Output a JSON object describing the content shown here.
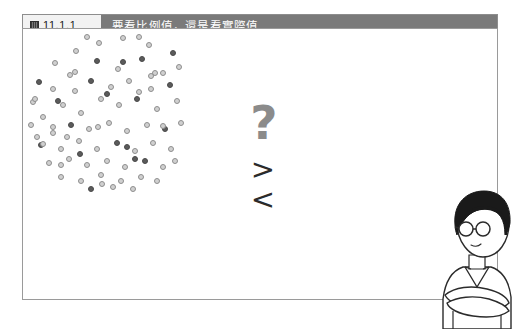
{
  "figure": {
    "number_label": "11.1.1",
    "number_icon": "figure-grid-icon",
    "title": "要看比例值，還是看實際值"
  },
  "comparison": {
    "question_symbol": "?",
    "greater_symbol": ">",
    "less_symbol": "<"
  },
  "colors": {
    "header_bar": "#7a7a7a",
    "number_box": "#f2f2f2",
    "title_text": "#ffffff",
    "dish_fill": "#dedede",
    "dish_stroke": "#5e5e5e",
    "dot_ring_fill": "#d0d0d0",
    "dot_ring_stroke": "#8e8e8e",
    "dot_solid": "#5b5b5b",
    "question_mark": "#8b8b8b",
    "chevron": "#2b2b2b",
    "frame_border": "#9a9a9a",
    "hair": "#1a1a1a",
    "skin": "#ffffff",
    "outline": "#2b2b2b"
  },
  "dish_left": {
    "label": "dense-dish",
    "dot_count": 68,
    "dots": [
      {
        "x": 53,
        "y": 22,
        "t": "ring"
      },
      {
        "x": 76,
        "y": 14,
        "t": "ring"
      },
      {
        "x": 100,
        "y": 9,
        "t": "ring"
      },
      {
        "x": 126,
        "y": 16,
        "t": "ring"
      },
      {
        "x": 150,
        "y": 24,
        "t": "solid"
      },
      {
        "x": 32,
        "y": 34,
        "t": "ring"
      },
      {
        "x": 16,
        "y": 53,
        "t": "solid"
      },
      {
        "x": 47,
        "y": 46,
        "t": "ring"
      },
      {
        "x": 74,
        "y": 32,
        "t": "solid"
      },
      {
        "x": 95,
        "y": 40,
        "t": "ring"
      },
      {
        "x": 119,
        "y": 30,
        "t": "solid"
      },
      {
        "x": 140,
        "y": 44,
        "t": "ring"
      },
      {
        "x": 156,
        "y": 38,
        "t": "ring"
      },
      {
        "x": 10,
        "y": 73,
        "t": "ring"
      },
      {
        "x": 30,
        "y": 60,
        "t": "ring"
      },
      {
        "x": 52,
        "y": 62,
        "t": "ring"
      },
      {
        "x": 68,
        "y": 52,
        "t": "solid"
      },
      {
        "x": 88,
        "y": 58,
        "t": "ring"
      },
      {
        "x": 106,
        "y": 52,
        "t": "ring"
      },
      {
        "x": 128,
        "y": 60,
        "t": "ring"
      },
      {
        "x": 147,
        "y": 56,
        "t": "solid"
      },
      {
        "x": 20,
        "y": 88,
        "t": "ring"
      },
      {
        "x": 40,
        "y": 76,
        "t": "ring"
      },
      {
        "x": 58,
        "y": 84,
        "t": "ring"
      },
      {
        "x": 78,
        "y": 70,
        "t": "ring"
      },
      {
        "x": 96,
        "y": 76,
        "t": "ring"
      },
      {
        "x": 114,
        "y": 70,
        "t": "solid"
      },
      {
        "x": 134,
        "y": 80,
        "t": "ring"
      },
      {
        "x": 154,
        "y": 72,
        "t": "ring"
      },
      {
        "x": 8,
        "y": 96,
        "t": "ring"
      },
      {
        "x": 30,
        "y": 104,
        "t": "ring"
      },
      {
        "x": 48,
        "y": 96,
        "t": "solid"
      },
      {
        "x": 66,
        "y": 100,
        "t": "ring"
      },
      {
        "x": 86,
        "y": 94,
        "t": "ring"
      },
      {
        "x": 104,
        "y": 102,
        "t": "ring"
      },
      {
        "x": 124,
        "y": 96,
        "t": "ring"
      },
      {
        "x": 142,
        "y": 100,
        "t": "solid"
      },
      {
        "x": 158,
        "y": 94,
        "t": "ring"
      },
      {
        "x": 18,
        "y": 116,
        "t": "solid"
      },
      {
        "x": 38,
        "y": 120,
        "t": "ring"
      },
      {
        "x": 56,
        "y": 112,
        "t": "ring"
      },
      {
        "x": 74,
        "y": 120,
        "t": "ring"
      },
      {
        "x": 94,
        "y": 114,
        "t": "solid"
      },
      {
        "x": 112,
        "y": 122,
        "t": "ring"
      },
      {
        "x": 130,
        "y": 114,
        "t": "ring"
      },
      {
        "x": 148,
        "y": 120,
        "t": "ring"
      },
      {
        "x": 26,
        "y": 134,
        "t": "ring"
      },
      {
        "x": 46,
        "y": 130,
        "t": "ring"
      },
      {
        "x": 64,
        "y": 136,
        "t": "ring"
      },
      {
        "x": 84,
        "y": 132,
        "t": "ring"
      },
      {
        "x": 102,
        "y": 138,
        "t": "ring"
      },
      {
        "x": 122,
        "y": 132,
        "t": "solid"
      },
      {
        "x": 140,
        "y": 138,
        "t": "ring"
      },
      {
        "x": 38,
        "y": 148,
        "t": "ring"
      },
      {
        "x": 58,
        "y": 152,
        "t": "ring"
      },
      {
        "x": 78,
        "y": 146,
        "t": "ring"
      },
      {
        "x": 98,
        "y": 152,
        "t": "ring"
      },
      {
        "x": 118,
        "y": 148,
        "t": "ring"
      },
      {
        "x": 134,
        "y": 152,
        "t": "ring"
      },
      {
        "x": 68,
        "y": 160,
        "t": "solid"
      },
      {
        "x": 90,
        "y": 158,
        "t": "ring"
      },
      {
        "x": 110,
        "y": 160,
        "t": "ring"
      },
      {
        "x": 152,
        "y": 132,
        "t": "ring"
      },
      {
        "x": 14,
        "y": 108,
        "t": "ring"
      },
      {
        "x": 64,
        "y": 8,
        "t": "ring"
      },
      {
        "x": 116,
        "y": 8,
        "t": "ring"
      },
      {
        "x": 44,
        "y": 108,
        "t": "ring"
      },
      {
        "x": 132,
        "y": 44,
        "t": "ring"
      }
    ]
  },
  "dish_right": {
    "label": "sparse-dish",
    "dot_count": 16,
    "dots": [
      {
        "x": 100,
        "y": 33,
        "t": "solid"
      },
      {
        "x": 52,
        "y": 43,
        "t": "ring"
      },
      {
        "x": 84,
        "y": 65,
        "t": "solid"
      },
      {
        "x": 116,
        "y": 63,
        "t": "ring"
      },
      {
        "x": 12,
        "y": 70,
        "t": "ring"
      },
      {
        "x": 35,
        "y": 72,
        "t": "solid"
      },
      {
        "x": 30,
        "y": 98,
        "t": "ring"
      },
      {
        "x": 75,
        "y": 98,
        "t": "ring"
      },
      {
        "x": 140,
        "y": 97,
        "t": "ring"
      },
      {
        "x": 104,
        "y": 118,
        "t": "solid"
      },
      {
        "x": 57,
        "y": 125,
        "t": "solid"
      },
      {
        "x": 112,
        "y": 130,
        "t": "solid"
      },
      {
        "x": 38,
        "y": 136,
        "t": "ring"
      },
      {
        "x": 79,
        "y": 155,
        "t": "ring"
      },
      {
        "x": 128,
        "y": 47,
        "t": "ring"
      },
      {
        "x": 20,
        "y": 115,
        "t": "ring"
      }
    ]
  },
  "person": {
    "label": "thinking-person",
    "description": "person-with-glasses-arms-crossed"
  }
}
